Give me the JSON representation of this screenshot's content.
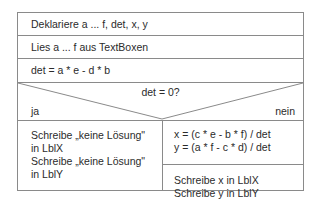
{
  "diagram": {
    "type": "Nassi-Shneiderman structogram",
    "rows": [
      {
        "text": "Deklariere a ... f, det, x,  y"
      },
      {
        "text": "Lies a ... f aus TextBoxen"
      },
      {
        "text": "det = a * e - d * b"
      }
    ],
    "decision": {
      "condition": "det = 0?",
      "true_label": "ja",
      "false_label": "nein"
    },
    "true_branch": {
      "block1": [
        "Schreibe „keine Lösung\"",
        "in LblX"
      ],
      "block2": [
        "Schreibe „keine Lösung\"",
        "in LblY"
      ]
    },
    "false_branch": {
      "block1": [
        "x = (c * e - b * f) / det",
        "y = (a * f - c * d) / det"
      ],
      "block2": [
        "Schreibe x in LblX",
        "Schreibe y in LblY"
      ]
    },
    "colors": {
      "line": "#8a8a8a",
      "text": "#2b2b2b",
      "background": "#ffffff"
    }
  }
}
